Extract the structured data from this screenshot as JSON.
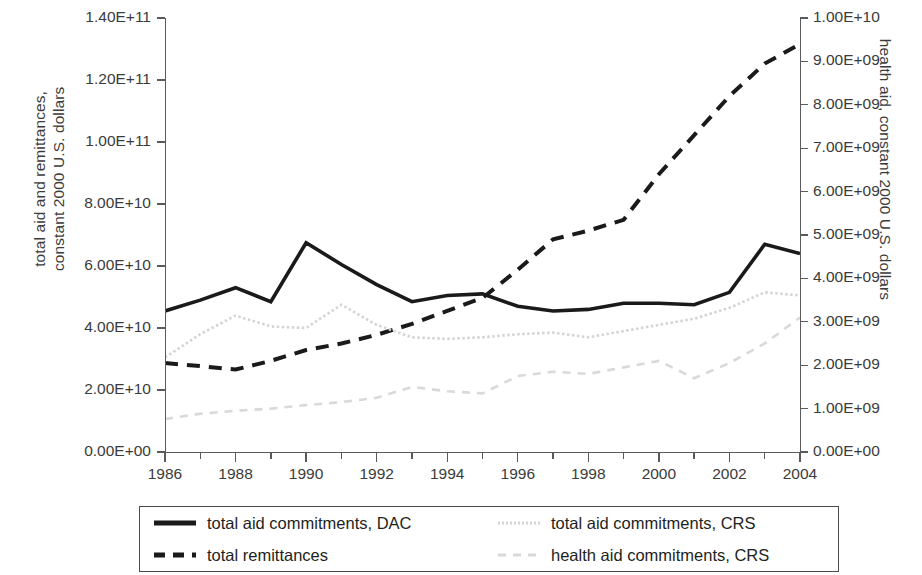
{
  "chart_data": {
    "type": "line",
    "title": "",
    "xlabel": "",
    "ylabel": "total aid and remittances,\nconstant 2000 U.S. dollars",
    "y2label": "health aid, constant 2000 U.S. dollars",
    "grid": false,
    "legend_position": "bottom",
    "xlim": [
      1986,
      2004
    ],
    "ylim": [
      0,
      140000000000
    ],
    "y2lim": [
      0,
      10000000000
    ],
    "x": [
      1986,
      1987,
      1988,
      1989,
      1990,
      1991,
      1992,
      1993,
      1994,
      1995,
      1996,
      1997,
      1998,
      1999,
      2000,
      2001,
      2002,
      2003,
      2004
    ],
    "xtick_labels": [
      "1986",
      "1988",
      "1990",
      "1992",
      "1994",
      "1996",
      "1998",
      "2000",
      "2002",
      "2004"
    ],
    "xtick_values": [
      1986,
      1988,
      1990,
      1992,
      1994,
      1996,
      1998,
      2000,
      2002,
      2004
    ],
    "ytick_labels": [
      "0.00E+00",
      "2.00E+10",
      "4.00E+10",
      "6.00E+10",
      "8.00E+10",
      "1.00E+11",
      "1.20E+11",
      "1.40E+11"
    ],
    "ytick_values": [
      0,
      20000000000,
      40000000000,
      60000000000,
      80000000000,
      100000000000,
      120000000000,
      140000000000
    ],
    "y2tick_labels": [
      "0.00E+00",
      "1.00E+09",
      "2.00E+09",
      "3.00E+09",
      "4.00E+09",
      "5.00E+09",
      "6.00E+09",
      "7.00E+09",
      "8.00E+09",
      "9.00E+09",
      "1.00E+10"
    ],
    "y2tick_values": [
      0,
      1000000000,
      2000000000,
      3000000000,
      4000000000,
      5000000000,
      6000000000,
      7000000000,
      8000000000,
      9000000000,
      10000000000
    ],
    "series": [
      {
        "name": "total aid commitments, DAC",
        "axis": "left",
        "color": "#1a1a1a",
        "style": "solid",
        "width": 3.6,
        "values": [
          45500000000,
          49000000000,
          53000000000,
          48500000000,
          67500000000,
          60500000000,
          54000000000,
          48500000000,
          50500000000,
          51000000000,
          47000000000,
          45500000000,
          46000000000,
          48000000000,
          48000000000,
          47500000000,
          51500000000,
          67000000000,
          64000000000
        ]
      },
      {
        "name": "total remittances",
        "axis": "right",
        "color": "#1a1a1a",
        "style": "dashed",
        "width": 4.0,
        "values": [
          2050000000,
          1980000000,
          1900000000,
          2100000000,
          2350000000,
          2500000000,
          2700000000,
          2950000000,
          3250000000,
          3550000000,
          4200000000,
          4900000000,
          5100000000,
          5350000000,
          6400000000,
          7300000000,
          8200000000,
          8950000000,
          9400000000
        ]
      },
      {
        "name": "total aid commitments, CRS",
        "axis": "left",
        "color": "#d4d4d4",
        "style": "dotted",
        "width": 2.6,
        "values": [
          30500000000,
          38000000000,
          44000000000,
          40500000000,
          40000000000,
          47500000000,
          41000000000,
          37000000000,
          36500000000,
          37000000000,
          38000000000,
          38500000000,
          37000000000,
          39000000000,
          41000000000,
          43000000000,
          46500000000,
          51500000000,
          50500000000
        ]
      },
      {
        "name": "health aid commitments, CRS",
        "axis": "right",
        "color": "#d9d9d9",
        "style": "dashed",
        "width": 2.6,
        "values": [
          760000000,
          880000000,
          950000000,
          1000000000,
          1080000000,
          1150000000,
          1250000000,
          1500000000,
          1400000000,
          1350000000,
          1750000000,
          1850000000,
          1800000000,
          1950000000,
          2100000000,
          1700000000,
          2050000000,
          2500000000,
          3100000000
        ]
      }
    ]
  },
  "legend": {
    "items": [
      {
        "label": "total aid commitments, DAC",
        "swatch": "solid-black-line"
      },
      {
        "label": "total aid commitments, CRS",
        "swatch": "dotted-gray-line"
      },
      {
        "label": "total remittances",
        "swatch": "dashed-black-line"
      },
      {
        "label": "health aid commitments, CRS",
        "swatch": "dashed-gray-line"
      }
    ]
  }
}
